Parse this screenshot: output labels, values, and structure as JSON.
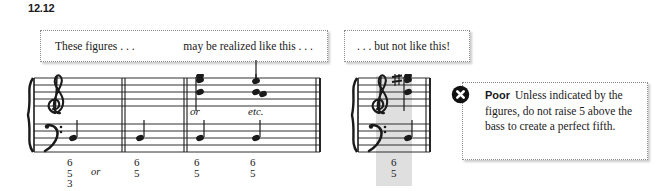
{
  "figure": {
    "number": "12.12"
  },
  "captions": {
    "left_first": "These figures . . .",
    "left_second": "may be realized like this . . .",
    "right": ". . . but not like this!"
  },
  "staff_left": {
    "brace_icon": "grand-staff-brace",
    "treble_clef_icon": "treble-clef",
    "bass_clef_icon": "bass-clef",
    "annotations": {
      "or": "or",
      "etc": "etc."
    },
    "measures": [
      {
        "index": 1,
        "bass_note": "bass-note-quarter",
        "figured_bass": [
          "6",
          "5",
          "3"
        ],
        "trailing_text": "or"
      },
      {
        "index": 2,
        "bass_note": "bass-note-quarter",
        "figured_bass": [
          "6",
          "5"
        ]
      },
      {
        "index": 3,
        "bass_note": "bass-note-quarter",
        "treble_chord": "three-note-chord-stem-down",
        "figured_bass": [
          "6",
          "5"
        ]
      },
      {
        "index": 4,
        "bass_note": "bass-note-quarter",
        "treble_chord": "two-note-chord-stem-up",
        "figured_bass": [
          "6",
          "5"
        ]
      }
    ]
  },
  "staff_right": {
    "brace_icon": "grand-staff-brace",
    "treble_clef_icon": "treble-clef",
    "bass_clef_icon": "bass-clef",
    "accidental_icon": "sharp-sign",
    "treble_chord": "three-note-chord-stem-down",
    "bass_note": "bass-note-quarter",
    "figured_bass": [
      "6",
      "5"
    ],
    "highlight_color": "#d4d4d4"
  },
  "callout": {
    "icon": "x-circle-icon",
    "label": "Poor",
    "body": "Unless indicated by the figures, do not raise 5 above the bass to create a perfect fifth."
  }
}
